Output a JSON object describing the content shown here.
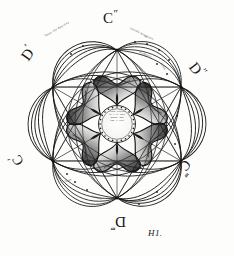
{
  "figure": {
    "plate_signature": "H1.",
    "ink_color": "#171717",
    "paper_color": "#fdfdfc",
    "shade_color": "#2a2a2a"
  },
  "labels": {
    "top": {
      "letter": "C",
      "mark": "″",
      "name": "C″"
    },
    "upper_left": {
      "letter": "D",
      "mark": "′",
      "name": "D′"
    },
    "upper_right": {
      "letter": "D",
      "mark": "″",
      "name": "D″"
    },
    "lower_left": {
      "letter": "C",
      "mark": "′",
      "name": "C′"
    },
    "lower_right": {
      "letter": "C",
      "mark": "‴",
      "name": "C‴"
    },
    "bottom": {
      "letter": "D",
      "mark": "‴",
      "name": "D‴"
    }
  },
  "center_medallion": {
    "lines": [
      "cento circulo",
      "In y la linea",
      "ondula don",
      "con il cent"
    ],
    "note": "engraved script, largely illegible"
  },
  "arc_inscriptions": [
    {
      "position": "top-left-arc",
      "text": "linea che descrive"
    },
    {
      "position": "top-right-arc",
      "text": "circolo maggiore"
    },
    {
      "position": "right-inner-arc",
      "text": "diametro"
    },
    {
      "position": "right-lower-arc",
      "text": "linea"
    },
    {
      "position": "bottom-left-arc",
      "text": "Dato"
    },
    {
      "position": "bottom-arc",
      "text": "circolo"
    }
  ],
  "geometry": {
    "node_count": 6,
    "lens_pairs": 6,
    "rosette_lobes": 6,
    "outer_radius": 96,
    "node_radius": 74,
    "rosette_radius": 44,
    "medallion_radius": 18
  }
}
